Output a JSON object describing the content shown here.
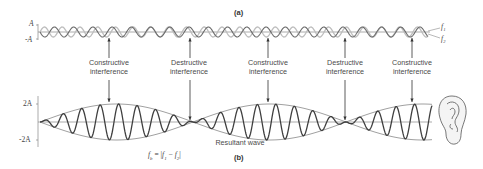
{
  "panel_a": {
    "label": "(a)",
    "y_axis": {
      "top": "A",
      "bottom": "-A"
    },
    "wave_labels": {
      "f1": "f₁",
      "f2": "f₂"
    }
  },
  "annotations": [
    {
      "line1": "Constructive",
      "line2": "interference",
      "type": "constructive"
    },
    {
      "line1": "Destructive",
      "line2": "interference",
      "type": "destructive"
    },
    {
      "line1": "Constructive",
      "line2": "interference",
      "type": "constructive"
    },
    {
      "line1": "Destructive",
      "line2": "interference",
      "type": "destructive"
    },
    {
      "line1": "Constructive",
      "line2": "interference",
      "type": "constructive"
    }
  ],
  "panel_b": {
    "label": "(b)",
    "y_axis": {
      "top": "2A",
      "bottom": "-2A"
    },
    "caption": "Resultant wave",
    "formula": "fb = |f1 − f2|",
    "formula_parts": {
      "lhs": "f",
      "lhs_sub": "b",
      "eq": " = |",
      "a": "f",
      "a_sub": "1",
      "minus": " − ",
      "b": "f",
      "b_sub": "2",
      "close": "|"
    }
  },
  "icons": {
    "ear": "ear-icon"
  },
  "colors": {
    "f1_wave": "#b8b8b8",
    "f2_wave": "#6a6a6a",
    "axis": "#777777",
    "resultant": "#444444",
    "envelope": "#666666",
    "text": "#4a4a4a"
  }
}
